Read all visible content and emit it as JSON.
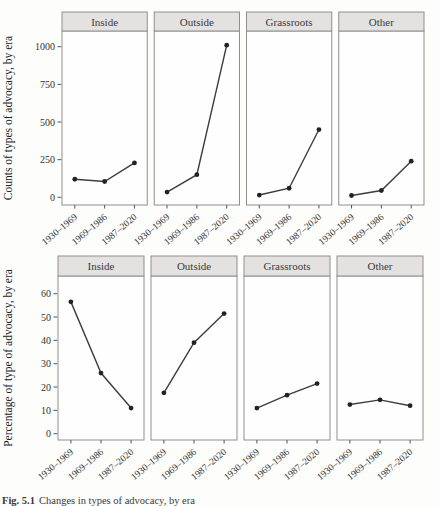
{
  "caption": {
    "label": "Fig. 5.1",
    "text": "Changes in types of advocacy, by era"
  },
  "colors": {
    "strip_fill": "#e4e2e1",
    "panel_border": "#8f8f8f",
    "plot_fill": "#fffefe",
    "line": "#3d3d3d",
    "point": "#222222",
    "tick": "#555555",
    "text": "#333333",
    "axis_title": "#222222"
  },
  "chart_data": [
    {
      "type": "line",
      "title": "",
      "xlabel": "",
      "ylabel": "Counts of types of advocacy, by era",
      "categories": [
        "1930–1969",
        "1969–1986",
        "1987–2020"
      ],
      "panels": [
        {
          "label": "Inside",
          "values": [
            120,
            105,
            228
          ]
        },
        {
          "label": "Outside",
          "values": [
            35,
            150,
            1010
          ]
        },
        {
          "label": "Grassroots",
          "values": [
            15,
            60,
            450
          ]
        },
        {
          "label": "Other",
          "values": [
            12,
            45,
            240
          ]
        }
      ],
      "yticks": [
        0,
        250,
        500,
        750,
        1000
      ],
      "ylim": [
        -45,
        1090
      ],
      "grid": false,
      "legend": "none"
    },
    {
      "type": "line",
      "title": "",
      "xlabel": "",
      "ylabel": "Percentage of type of advocacy, by era",
      "categories": [
        "1930–1969",
        "1969–1986",
        "1987–2020"
      ],
      "panels": [
        {
          "label": "Inside",
          "values": [
            56.5,
            26,
            11
          ]
        },
        {
          "label": "Outside",
          "values": [
            17.5,
            39,
            51.5
          ]
        },
        {
          "label": "Grassroots",
          "values": [
            11,
            16.5,
            21.5
          ]
        },
        {
          "label": "Other",
          "values": [
            12.5,
            14.5,
            12
          ]
        }
      ],
      "yticks": [
        0,
        10,
        20,
        30,
        40,
        50,
        60
      ],
      "ylim": [
        -2.5,
        67
      ],
      "grid": false,
      "legend": "none"
    }
  ]
}
